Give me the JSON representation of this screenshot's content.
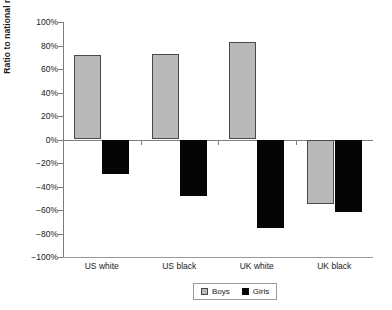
{
  "chart_data": {
    "type": "bar",
    "title": "",
    "subtitle": "",
    "xlabel": "",
    "ylabel": "Ratio to national mean",
    "categories": [
      "US white",
      "US black",
      "UK white",
      "UK black"
    ],
    "series": [
      {
        "name": "Boys",
        "color": "#b9b9b9",
        "values": [
          72,
          73,
          83,
          -55
        ]
      },
      {
        "name": "Girls",
        "color": "#050505",
        "values": [
          -29,
          -48,
          -75,
          -62
        ]
      }
    ],
    "ylim": [
      -100,
      100
    ],
    "ytick_step": 20,
    "ytick_labels": [
      "100%",
      "80%",
      "60%",
      "40%",
      "20%",
      "0%",
      "-20%",
      "-40%",
      "-60%",
      "-80%",
      "-100%"
    ],
    "ytick_values": [
      100,
      80,
      60,
      40,
      20,
      0,
      -20,
      -40,
      -60,
      -80,
      -100
    ],
    "value_suffix": "%",
    "grid": false,
    "legend_position": "bottom-center",
    "legend_entries": [
      "Boys",
      "Girls"
    ]
  }
}
